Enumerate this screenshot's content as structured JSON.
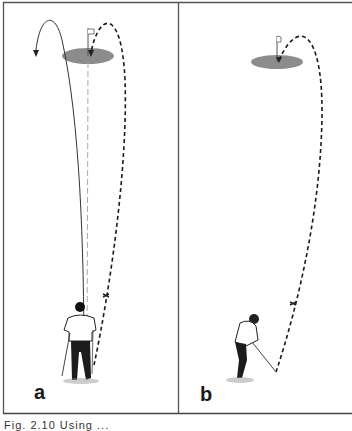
{
  "figure": {
    "panels": [
      {
        "id": "a",
        "label": "a",
        "description": "Golfer viewed from behind aligning at the flag; solid curved line hooks away left, dashed line curves right into the hole"
      },
      {
        "id": "b",
        "label": "b",
        "description": "Golfer at address; dashed ball flight curves from right into the hole on the green"
      }
    ],
    "caption": "Fig. 2.10   Using ...",
    "colors": {
      "line": "#1a1a1a",
      "green": "#8c8c8c",
      "frame": "#555555",
      "background": "#ffffff"
    }
  }
}
